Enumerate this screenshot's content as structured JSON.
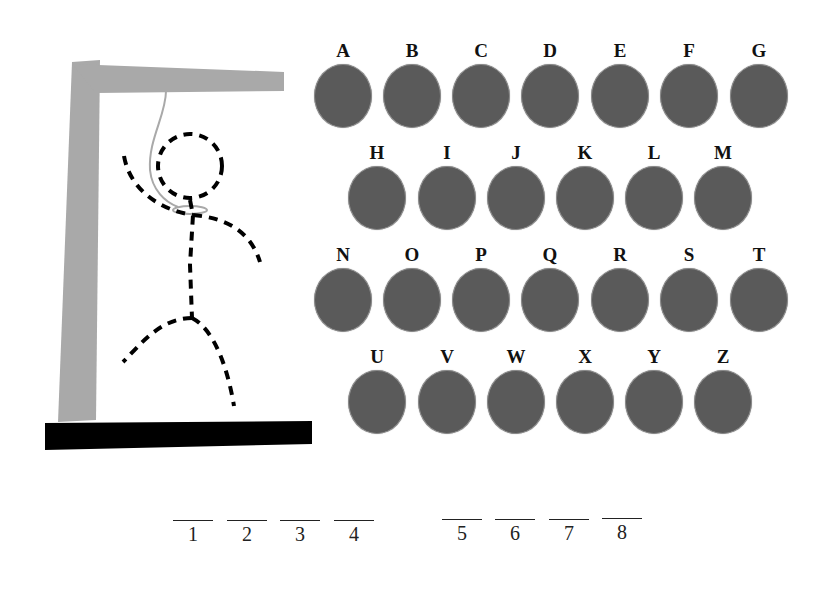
{
  "game": {
    "title": "Hangman",
    "colors": {
      "gallows": "#a9a9a9",
      "base": "#000000",
      "key_ball": "#5a5a5a",
      "figure": "#000000"
    }
  },
  "keyboard": {
    "rows": [
      {
        "y": 40,
        "keys": [
          {
            "letter": "A",
            "x": 314
          },
          {
            "letter": "B",
            "x": 383
          },
          {
            "letter": "C",
            "x": 452
          },
          {
            "letter": "D",
            "x": 521
          },
          {
            "letter": "E",
            "x": 591
          },
          {
            "letter": "F",
            "x": 660
          },
          {
            "letter": "G",
            "x": 730
          }
        ]
      },
      {
        "y": 142,
        "keys": [
          {
            "letter": "H",
            "x": 348
          },
          {
            "letter": "I",
            "x": 418
          },
          {
            "letter": "J",
            "x": 487
          },
          {
            "letter": "K",
            "x": 556
          },
          {
            "letter": "L",
            "x": 625
          },
          {
            "letter": "M",
            "x": 694
          }
        ]
      },
      {
        "y": 244,
        "keys": [
          {
            "letter": "N",
            "x": 314
          },
          {
            "letter": "O",
            "x": 383
          },
          {
            "letter": "P",
            "x": 452
          },
          {
            "letter": "Q",
            "x": 521
          },
          {
            "letter": "R",
            "x": 591
          },
          {
            "letter": "S",
            "x": 660
          },
          {
            "letter": "T",
            "x": 730
          }
        ]
      },
      {
        "y": 346,
        "keys": [
          {
            "letter": "U",
            "x": 348
          },
          {
            "letter": "V",
            "x": 418
          },
          {
            "letter": "W",
            "x": 487
          },
          {
            "letter": "X",
            "x": 556
          },
          {
            "letter": "Y",
            "x": 625
          },
          {
            "letter": "Z",
            "x": 694
          }
        ]
      }
    ]
  },
  "word_slots": [
    {
      "label": "1",
      "x": 173,
      "y": 520
    },
    {
      "label": "2",
      "x": 227,
      "y": 520
    },
    {
      "label": "3",
      "x": 280,
      "y": 520
    },
    {
      "label": "4",
      "x": 334,
      "y": 520
    },
    {
      "label": "5",
      "x": 442,
      "y": 519
    },
    {
      "label": "6",
      "x": 495,
      "y": 519
    },
    {
      "label": "7",
      "x": 549,
      "y": 519
    },
    {
      "label": "8",
      "x": 602,
      "y": 518
    }
  ]
}
